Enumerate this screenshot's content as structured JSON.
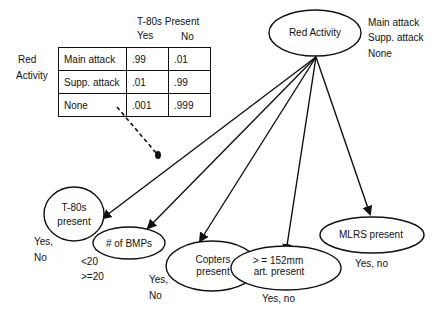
{
  "cpt": {
    "parent_label_line1": "Red",
    "parent_label_line2": "Activity",
    "column_header": "T-80s Present",
    "col_yes": "Yes",
    "col_no": "No",
    "rows": [
      {
        "state": "Main attack",
        "yes": ".99",
        "no": ".01"
      },
      {
        "state": "Supp. attack",
        "yes": ".01",
        "no": ".99"
      },
      {
        "state": "None",
        "yes": ".001",
        "no": ".999"
      }
    ]
  },
  "root": {
    "label": "Red Activity",
    "states": [
      "Main attack",
      "Supp. attack",
      "None"
    ]
  },
  "children": [
    {
      "label_line1": "T-80s",
      "label_line2": "present",
      "states_line1": "Yes,",
      "states_line2": "No"
    },
    {
      "label_line1": "# of BMPs",
      "label_line2": "",
      "states_line1": "<20",
      "states_line2": ">=20"
    },
    {
      "label_line1": "Copters",
      "label_line2": "present",
      "states_line1": "Yes,",
      "states_line2": "No"
    },
    {
      "label_line1": "> = 152mm",
      "label_line2": "art. present",
      "states_line1": "Yes, no",
      "states_line2": ""
    },
    {
      "label_line1": "MLRS present",
      "label_line2": "",
      "states_line1": "Yes, no",
      "states_line2": ""
    }
  ]
}
